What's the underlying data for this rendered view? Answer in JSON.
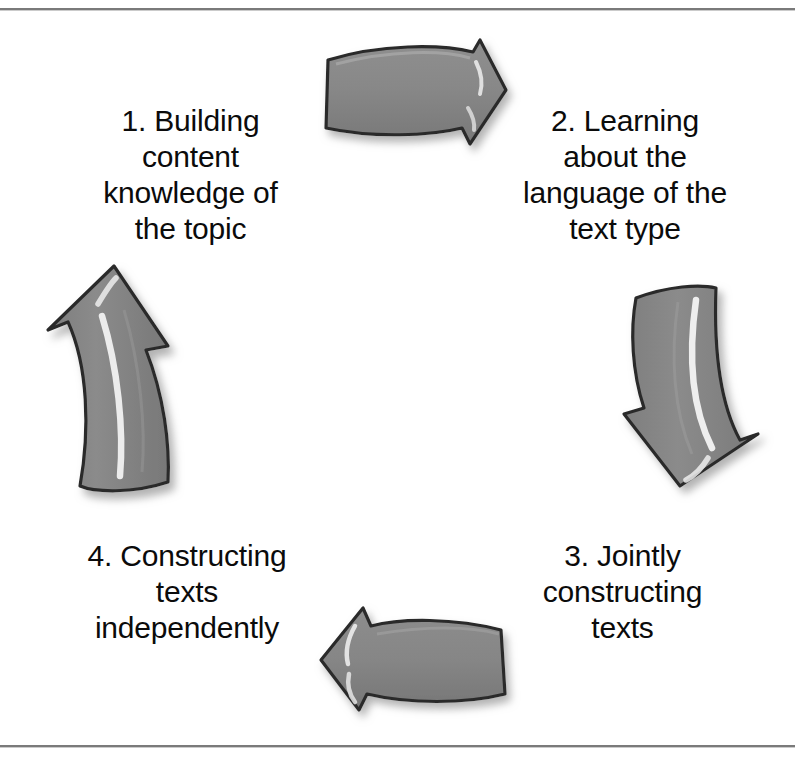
{
  "diagram": {
    "background_color": "#ffffff",
    "text_color": "#0b0b0b",
    "rule_color": "#7a7a7a",
    "arrow": {
      "fill_color": "#8a8a8a",
      "fill_color_dark": "#6f6f6f",
      "outline_color": "#2a2a2a",
      "highlight_color": "#f2f2f2",
      "shadow_color": "#b8b8b8"
    },
    "stages": [
      {
        "id": "stage-1",
        "number": "1.",
        "label": "1. Building\ncontent\nknowledge of\nthe topic",
        "position": "top-left"
      },
      {
        "id": "stage-2",
        "number": "2.",
        "label": "2. Learning\nabout the\nlanguage of the\ntext type",
        "position": "top-right"
      },
      {
        "id": "stage-3",
        "number": "3.",
        "label": "3. Jointly\nconstructing\ntexts",
        "position": "bottom-right"
      },
      {
        "id": "stage-4",
        "number": "4.",
        "label": "4. Constructing\ntexts\nindependently",
        "position": "bottom-left"
      }
    ],
    "arrows": [
      {
        "id": "arrow-top",
        "icon": "arrow-right-icon",
        "direction": "right",
        "from": "stage-1",
        "to": "stage-2"
      },
      {
        "id": "arrow-right",
        "icon": "arrow-down-icon",
        "direction": "down",
        "from": "stage-2",
        "to": "stage-3"
      },
      {
        "id": "arrow-bottom",
        "icon": "arrow-left-icon",
        "direction": "left",
        "from": "stage-3",
        "to": "stage-4"
      },
      {
        "id": "arrow-left",
        "icon": "arrow-up-icon",
        "direction": "up",
        "from": "stage-4",
        "to": "stage-1"
      }
    ]
  }
}
